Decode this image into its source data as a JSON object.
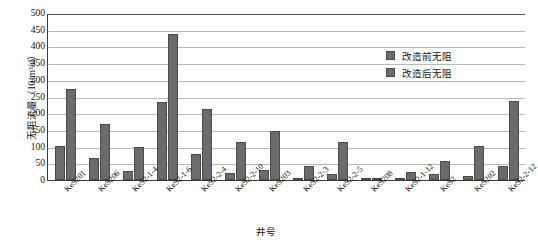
{
  "chart_data": {
    "type": "bar",
    "title": "",
    "xlabel": "井号",
    "ylabel": "无阻流量（10⁴m³/d）",
    "ylim": [
      0,
      500
    ],
    "ytick_step": 50,
    "yticks": [
      "0",
      "50",
      "100",
      "150",
      "200",
      "250",
      "300",
      "350",
      "400",
      "450",
      "500"
    ],
    "grid": "horizontal",
    "legend_position": "top-right-inside",
    "bar_color": "#6b6b6b",
    "categories": [
      "KeS201",
      "KeS206",
      "KeS2-1-4",
      "KeS2-1-6",
      "KeS2-2-4",
      "KeS2-2-10",
      "KeS203",
      "KeS2-2-3",
      "KeS2-2-5",
      "KeS208",
      "KeS2-1-12",
      "KeS2",
      "KeS202",
      "KeS2-2-12"
    ],
    "series": [
      {
        "name": "改造前无阻",
        "values": [
          103,
          65,
          28,
          233,
          78,
          20,
          30,
          5,
          18,
          3,
          2,
          17,
          12,
          43
        ]
      },
      {
        "name": "改造后无阻",
        "values": [
          273,
          168,
          98,
          438,
          212,
          113,
          148,
          42,
          115,
          7,
          25,
          56,
          103,
          237
        ]
      }
    ]
  }
}
